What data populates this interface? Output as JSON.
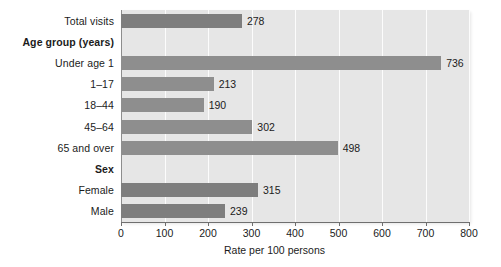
{
  "chart_data": {
    "type": "bar",
    "orientation": "horizontal",
    "title": "",
    "xlabel": "Rate per 100 persons",
    "ylabel": "",
    "xlim": [
      0,
      800
    ],
    "xticks": [
      0,
      100,
      200,
      300,
      400,
      500,
      600,
      700,
      800
    ],
    "xtick_labels": [
      "0",
      "100",
      "200",
      "300",
      "400",
      "500",
      "600",
      "700",
      "800"
    ],
    "grid": "vertical-white-at-xticks",
    "legend": "none",
    "bar_color": "#8e8e8e",
    "bar_color_dark": "#7e7e7e",
    "plot_background": "#e6e6e6",
    "categories": [
      "Total visits",
      "Age group (years)",
      "Under age 1",
      "1–17",
      "18–44",
      "45–64",
      "65 and over",
      "Sex",
      "Female",
      "Male"
    ],
    "rows": [
      {
        "label": "Total visits",
        "is_header": false,
        "value": 278,
        "value_label": "278",
        "shade": "dark"
      },
      {
        "label": "Age group (years)",
        "is_header": true,
        "value": null,
        "value_label": "",
        "shade": "none"
      },
      {
        "label": "Under age 1",
        "is_header": false,
        "value": 736,
        "value_label": "736",
        "shade": "light"
      },
      {
        "label": "1–17",
        "is_header": false,
        "value": 213,
        "value_label": "213",
        "shade": "light"
      },
      {
        "label": "18–44",
        "is_header": false,
        "value": 190,
        "value_label": "190",
        "shade": "light"
      },
      {
        "label": "45–64",
        "is_header": false,
        "value": 302,
        "value_label": "302",
        "shade": "light"
      },
      {
        "label": "65 and over",
        "is_header": false,
        "value": 498,
        "value_label": "498",
        "shade": "light"
      },
      {
        "label": "Sex",
        "is_header": true,
        "value": null,
        "value_label": "",
        "shade": "none"
      },
      {
        "label": "Female",
        "is_header": false,
        "value": 315,
        "value_label": "315",
        "shade": "dark"
      },
      {
        "label": "Male",
        "is_header": false,
        "value": 239,
        "value_label": "239",
        "shade": "dark"
      }
    ],
    "values": [
      278,
      null,
      736,
      213,
      190,
      302,
      498,
      null,
      315,
      239
    ]
  },
  "axis": {
    "x_title": "Rate per 100 persons"
  }
}
